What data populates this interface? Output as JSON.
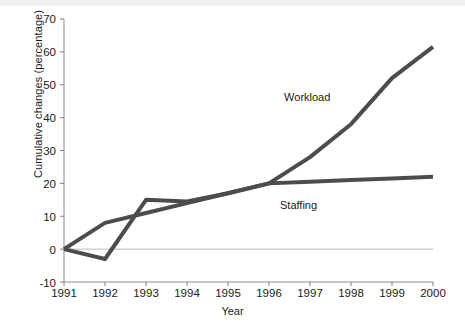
{
  "chart_data": {
    "type": "line",
    "title": "",
    "xlabel": "Year",
    "ylabel": "Cumulative changes (percentage)",
    "categories": [
      "1991",
      "1992",
      "1993",
      "1994",
      "1995",
      "1996",
      "1997",
      "1998",
      "1999",
      "2000"
    ],
    "x": [
      1991,
      1992,
      1993,
      1994,
      1995,
      1996,
      1997,
      1998,
      1999,
      2000
    ],
    "xlim": [
      1991,
      2000
    ],
    "ylim": [
      -10,
      70
    ],
    "yticks": [
      -10,
      0,
      10,
      20,
      30,
      40,
      50,
      60,
      70
    ],
    "ytick_labels": [
      "-10",
      "0",
      "10",
      "20",
      "30",
      "40",
      "50",
      "60",
      "70"
    ],
    "grid": false,
    "legend_position": "inline-annotations",
    "series": [
      {
        "name": "Workload",
        "values": [
          0,
          -3,
          15,
          14.5,
          17,
          20,
          28,
          38,
          52,
          61.5
        ],
        "color": "#4c4c4c",
        "label_x": 1997.1,
        "label_y": 46
      },
      {
        "name": "Staffing",
        "values": [
          0,
          8,
          11,
          14,
          17,
          20,
          20.5,
          21,
          21.5,
          22
        ],
        "color": "#4c4c4c",
        "label_x": 1997.0,
        "label_y": 13
      }
    ],
    "annotations": [
      {
        "text": "Workload",
        "series": "Workload"
      },
      {
        "text": "Staffing",
        "series": "Staffing"
      }
    ],
    "zero_line": 0,
    "line_width": 4,
    "axis_color": "#808080"
  },
  "axis": {
    "y_title": "Cumulative changes (percentage)",
    "x_title": "Year"
  },
  "yticks": [
    {
      "label": "70"
    },
    {
      "label": "60"
    },
    {
      "label": "50"
    },
    {
      "label": "40"
    },
    {
      "label": "30"
    },
    {
      "label": "20"
    },
    {
      "label": "10"
    },
    {
      "label": "0"
    },
    {
      "label": "-10"
    }
  ],
  "xticks": [
    {
      "label": "1991"
    },
    {
      "label": "1992"
    },
    {
      "label": "1993"
    },
    {
      "label": "1994"
    },
    {
      "label": "1995"
    },
    {
      "label": "1996"
    },
    {
      "label": "1997"
    },
    {
      "label": "1998"
    },
    {
      "label": "1999"
    },
    {
      "label": "2000"
    }
  ],
  "series_labels": {
    "workload": "Workload",
    "staffing": "Staffing"
  }
}
